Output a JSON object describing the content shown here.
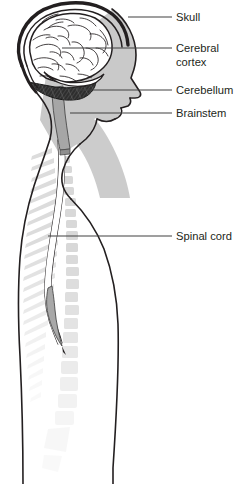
{
  "figure": {
    "background_color": "#ffffff",
    "width": 251,
    "height": 484
  },
  "colors": {
    "outline": "#231f20",
    "leader_line": "#404040",
    "label_text": "#231f20",
    "head_shading": "#c9c9c9",
    "brain_fill": "#ffffff",
    "skull_band": "#e8e8e8",
    "cerebellum_fill": "#2b2b2b",
    "brainstem_fill": "#a6a6a6",
    "spinal_cord_fill": "#ffffff",
    "conus_fill": "#a8a8a8",
    "vertebra_fill": "#d8d8d8",
    "vertebra_fill_faint": "#ececec",
    "rib_fill": "#dcdcdc",
    "body_fill": "#ffffff"
  },
  "labels": [
    {
      "id": "skull",
      "lines": [
        "Skull"
      ],
      "text_x": 176,
      "text_y": 21,
      "leader": {
        "x1": 128,
        "y1": 17,
        "x2": 172,
        "y2": 17
      }
    },
    {
      "id": "cerebral-cortex",
      "lines": [
        "Cerebral",
        "cortex"
      ],
      "text_x": 176,
      "text_y": 52,
      "leader": {
        "x1": 62,
        "y1": 48,
        "x2": 172,
        "y2": 48
      }
    },
    {
      "id": "cerebellum",
      "lines": [
        "Cerebellum"
      ],
      "text_x": 176,
      "text_y": 94,
      "leader": {
        "x1": 78,
        "y1": 90,
        "x2": 172,
        "y2": 90
      }
    },
    {
      "id": "brainstem",
      "lines": [
        "Brainstem"
      ],
      "text_x": 176,
      "text_y": 117,
      "leader": {
        "x1": 70,
        "y1": 113,
        "x2": 172,
        "y2": 113
      }
    },
    {
      "id": "spinal-cord",
      "lines": [
        "Spinal cord"
      ],
      "text_x": 176,
      "text_y": 240,
      "leader": {
        "x1": 48,
        "y1": 236,
        "x2": 172,
        "y2": 236
      }
    }
  ],
  "anatomy": {
    "skull": "skull-outline",
    "cerebral_cortex": "brain-gyri",
    "cerebellum": "cerebellum-hatched",
    "brainstem": "brainstem-band",
    "spinal_cord": "spinal-cord-channel",
    "vertebral_column": "vertebrae-stack",
    "body_profile": "head-neck-torso-profile"
  }
}
